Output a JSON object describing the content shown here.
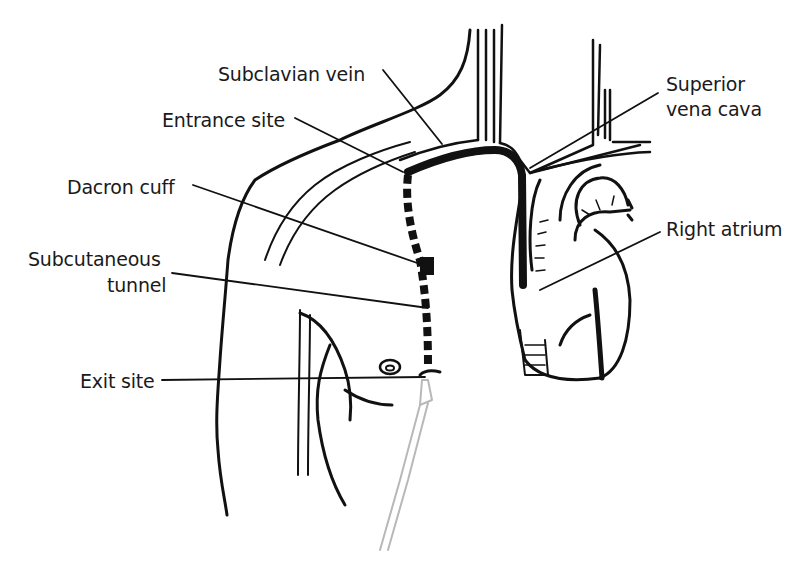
{
  "diagram": {
    "type": "anatomical illustration",
    "labels": {
      "subclavian_vein": "Subclavian vein",
      "entrance_site": "Entrance site",
      "dacron_cuff": "Dacron cuff",
      "subcutaneous_tunnel_line1": "Subcutaneous",
      "subcutaneous_tunnel_line2": "tunnel",
      "exit_site": "Exit site",
      "superior_vena_cava_line1": "Superior",
      "superior_vena_cava_line2": "vena cava",
      "right_atrium": "Right atrium"
    },
    "colors": {
      "ink": "#111111",
      "catheter_external": "#b8b8b8",
      "background": "#ffffff"
    }
  }
}
